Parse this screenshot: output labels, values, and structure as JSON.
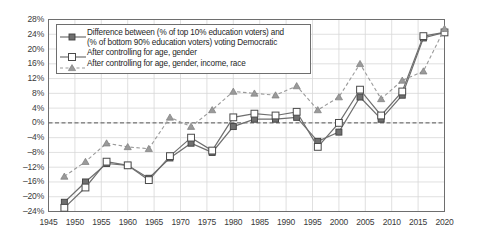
{
  "chart_data": {
    "type": "line",
    "title": "",
    "xlabel": "",
    "ylabel": "",
    "xlim": [
      1945,
      2020
    ],
    "ylim": [
      -24,
      28
    ],
    "ytick_step": 4,
    "xtick_step": 5,
    "grid": true,
    "zero_line": true,
    "legend_position": "top-left-inside",
    "ytick_labels": [
      "28%",
      "24%",
      "20%",
      "16%",
      "12%",
      "8%",
      "4%",
      "0%",
      "–4%",
      "–8%",
      "–12%",
      "–16%",
      "–20%",
      "–24%"
    ],
    "ytick_values": [
      28,
      24,
      20,
      16,
      12,
      8,
      4,
      0,
      -4,
      -8,
      -12,
      -16,
      -20,
      -24
    ],
    "xtick_labels": [
      "1945",
      "1950",
      "1955",
      "1960",
      "1965",
      "1970",
      "1975",
      "1980",
      "1985",
      "1990",
      "1995",
      "2000",
      "2005",
      "2010",
      "2015",
      "2020"
    ],
    "xtick_values": [
      1945,
      1950,
      1955,
      1960,
      1965,
      1970,
      1975,
      1980,
      1985,
      1990,
      1995,
      2000,
      2005,
      2010,
      2015,
      2020
    ],
    "x": [
      1948,
      1952,
      1956,
      1960,
      1964,
      1968,
      1972,
      1976,
      1980,
      1984,
      1988,
      1992,
      1996,
      2000,
      2004,
      2008,
      2012,
      2016,
      2020
    ],
    "series": [
      {
        "name": "Difference between (% of top 10% education voters) and (% of bottom 90% education voters) voting Democratic",
        "marker": "filled-square",
        "line": "solid",
        "color": "#6f6f6f",
        "values": [
          -21.5,
          -16.0,
          -11.0,
          -11.5,
          -15.0,
          -9.5,
          -5.5,
          -8.0,
          -1.0,
          1.0,
          1.0,
          1.5,
          -5.0,
          -2.5,
          7.0,
          1.0,
          7.5,
          23.0,
          24.5
        ]
      },
      {
        "name": "After controlling for age, gender",
        "marker": "open-square",
        "line": "solid",
        "color": "#6f6f6f",
        "values": [
          -23.0,
          -17.5,
          -10.5,
          -11.5,
          -15.5,
          -9.0,
          -4.0,
          -7.5,
          1.5,
          2.5,
          2.0,
          3.0,
          -6.5,
          0.0,
          9.0,
          2.0,
          8.5,
          23.5,
          24.5
        ]
      },
      {
        "name": "After controlling for age, gender, income, race",
        "marker": "triangle",
        "line": "dashed",
        "color": "#9a9a9a",
        "values": [
          -14.5,
          -10.5,
          -5.5,
          -6.5,
          -7.0,
          1.5,
          -1.0,
          3.5,
          8.5,
          8.0,
          7.5,
          10.0,
          3.5,
          7.0,
          16.0,
          6.5,
          11.5,
          14.0,
          25.5
        ]
      }
    ]
  },
  "legend": {
    "items": [
      {
        "line1": "Difference between (% of top 10% education voters) and",
        "line2": "(% of bottom 90% education voters) voting Democratic",
        "marker": "filled-square-line-icon"
      },
      {
        "line1": "After controlling for age, gender",
        "line2": "",
        "marker": "open-square-line-icon"
      },
      {
        "line1": "After controlling for age, gender, income, race",
        "line2": "",
        "marker": "triangle-dashed-line-icon"
      }
    ]
  }
}
